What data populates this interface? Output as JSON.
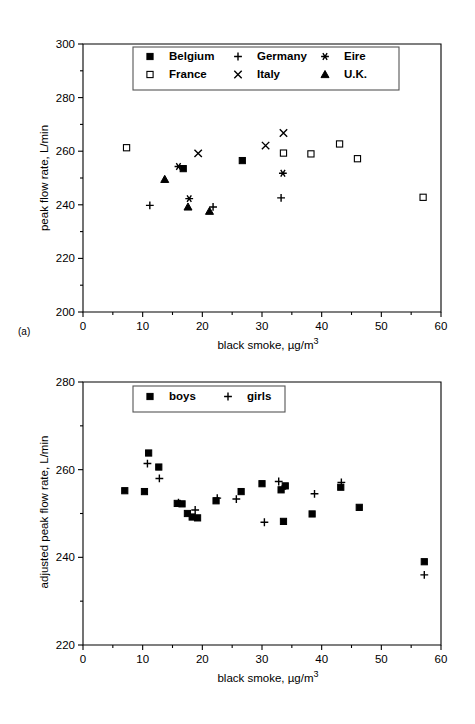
{
  "figure": {
    "panel_a_tag": "(a)",
    "panel_b_tag": "(b)"
  },
  "chart_data": [
    {
      "id": "panel-a",
      "type": "scatter",
      "title": "",
      "xlabel": "black smoke, µg/m",
      "xlabel_exponent": "3",
      "ylabel": "peak flow rate, L/min",
      "xlim": [
        0,
        60
      ],
      "ylim": [
        200,
        300
      ],
      "xticks": [
        0,
        10,
        20,
        30,
        40,
        50,
        60
      ],
      "xticklabels": [
        "0",
        "10",
        "20",
        "30",
        "40",
        "50",
        "60"
      ],
      "yticks": [
        200,
        220,
        240,
        260,
        280,
        300
      ],
      "yticklabels": [
        "200",
        "220",
        "240",
        "260",
        "280",
        "300"
      ],
      "grid": false,
      "legend_position": "upper-center",
      "series": [
        {
          "name": "Belgium",
          "marker": "filled-square",
          "points": [
            [
              16.8,
              253.5
            ],
            [
              26.7,
              256.5
            ]
          ]
        },
        {
          "name": "France",
          "marker": "open-square",
          "points": [
            [
              7.3,
              261.3
            ],
            [
              33.6,
              259.3
            ],
            [
              38.2,
              259.0
            ],
            [
              43.0,
              262.7
            ],
            [
              46.0,
              257.2
            ],
            [
              57.0,
              242.8
            ]
          ]
        },
        {
          "name": "Germany",
          "marker": "plus",
          "points": [
            [
              11.2,
              239.8
            ],
            [
              21.8,
              239.2
            ],
            [
              33.2,
              242.6
            ]
          ]
        },
        {
          "name": "Italy",
          "marker": "cross",
          "points": [
            [
              19.3,
              259.2
            ],
            [
              30.6,
              262.1
            ],
            [
              33.6,
              266.8
            ]
          ]
        },
        {
          "name": "Eire",
          "marker": "asterisk",
          "points": [
            [
              16.0,
              254.3
            ],
            [
              17.8,
              242.3
            ],
            [
              33.5,
              251.8
            ]
          ]
        },
        {
          "name": "U.K.",
          "marker": "filled-triangle",
          "points": [
            [
              13.7,
              249.5
            ],
            [
              17.6,
              239.2
            ],
            [
              21.2,
              237.6
            ]
          ]
        }
      ]
    },
    {
      "id": "panel-b",
      "type": "scatter",
      "title": "",
      "xlabel": "black smoke, µg/m",
      "xlabel_exponent": "3",
      "ylabel": "adjusted peak flow rate, L/min",
      "xlim": [
        0,
        60
      ],
      "ylim": [
        220,
        280
      ],
      "xticks": [
        0,
        10,
        20,
        30,
        40,
        50,
        60
      ],
      "xticklabels": [
        "0",
        "10",
        "20",
        "30",
        "40",
        "50",
        "60"
      ],
      "yticks": [
        220,
        240,
        260,
        280
      ],
      "yticklabels": [
        "220",
        "240",
        "260",
        "280"
      ],
      "grid": false,
      "legend_position": "upper-center",
      "series": [
        {
          "name": "boys",
          "marker": "filled-square",
          "points": [
            [
              7.0,
              255.2
            ],
            [
              11.0,
              263.8
            ],
            [
              12.7,
              260.6
            ],
            [
              10.3,
              255.0
            ],
            [
              15.8,
              252.3
            ],
            [
              16.6,
              252.2
            ],
            [
              17.5,
              250.0
            ],
            [
              18.3,
              249.2
            ],
            [
              19.2,
              249.0
            ],
            [
              22.3,
              252.9
            ],
            [
              26.5,
              255.0
            ],
            [
              30.0,
              256.8
            ],
            [
              33.2,
              255.4
            ],
            [
              33.9,
              256.3
            ],
            [
              33.6,
              248.2
            ],
            [
              38.4,
              249.9
            ],
            [
              43.2,
              256.0
            ],
            [
              46.3,
              251.4
            ],
            [
              57.2,
              239.0
            ]
          ]
        },
        {
          "name": "girls",
          "marker": "plus",
          "points": [
            [
              10.8,
              261.4
            ],
            [
              12.8,
              258.0
            ],
            [
              16.0,
              252.5
            ],
            [
              18.8,
              250.8
            ],
            [
              22.5,
              253.5
            ],
            [
              25.7,
              253.3
            ],
            [
              30.4,
              248.0
            ],
            [
              32.8,
              257.3
            ],
            [
              33.4,
              255.6
            ],
            [
              38.8,
              254.5
            ],
            [
              43.3,
              257.1
            ],
            [
              57.2,
              236.0
            ]
          ]
        }
      ]
    }
  ]
}
